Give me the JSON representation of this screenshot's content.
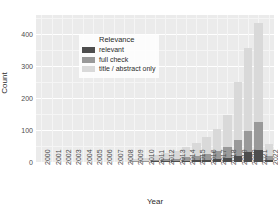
{
  "chart_data": {
    "type": "bar",
    "title": "",
    "xlabel": "Year",
    "ylabel": "Count",
    "stacked": true,
    "grid": true,
    "legend_position": "top-left-inside",
    "legend_title": "Relevance",
    "ylim": [
      0,
      460
    ],
    "yticks": [
      0,
      100,
      200,
      300,
      400
    ],
    "ytick_labels": [
      "0",
      "100",
      "200",
      "300",
      "400"
    ],
    "categories": [
      "2000",
      "2001",
      "2002",
      "2003",
      "2004",
      "2005",
      "2006",
      "2007",
      "2008",
      "2009",
      "2010",
      "2011",
      "2012",
      "2013",
      "2014",
      "2015",
      "2016",
      "2017",
      "2018",
      "2019",
      "2020",
      "2021",
      "2022"
    ],
    "series": [
      {
        "name": "relevant",
        "color": "#4d4d4d",
        "values": [
          0,
          0,
          0,
          0,
          0,
          0,
          0,
          0,
          0,
          1,
          1,
          2,
          2,
          3,
          4,
          5,
          7,
          9,
          13,
          20,
          30,
          38,
          6
        ]
      },
      {
        "name": "full check",
        "color": "#999999",
        "values": [
          0,
          0,
          0,
          0,
          0,
          0,
          0,
          0,
          0,
          2,
          3,
          5,
          6,
          8,
          11,
          14,
          19,
          25,
          34,
          48,
          66,
          86,
          12
        ]
      },
      {
        "name": "title / abstract only",
        "color": "#d9d9d9",
        "values": [
          0,
          0,
          0,
          0,
          0,
          1,
          0,
          0,
          1,
          5,
          9,
          14,
          19,
          24,
          32,
          40,
          53,
          70,
          100,
          182,
          262,
          311,
          38
        ]
      }
    ],
    "totals": [
      0,
      0,
      0,
      0,
      0,
      1,
      0,
      0,
      1,
      8,
      13,
      21,
      27,
      35,
      47,
      59,
      79,
      104,
      147,
      250,
      358,
      435,
      56
    ]
  },
  "axes": {
    "y_title": "Count",
    "x_title": "Year"
  },
  "legend": {
    "title": "Relevance",
    "entries": [
      {
        "label": "relevant",
        "color": "#4d4d4d"
      },
      {
        "label": "full check",
        "color": "#999999"
      },
      {
        "label": "title / abstract only",
        "color": "#d9d9d9"
      }
    ]
  },
  "panel": {
    "background": "#ebebeb",
    "gridline_major": "#ffffff",
    "gridline_minor": "#f5f5f5"
  }
}
